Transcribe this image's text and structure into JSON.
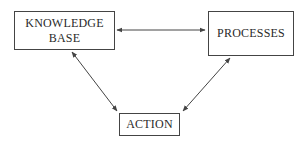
{
  "diagram": {
    "type": "flow",
    "nodes": [
      {
        "id": "knowledge_base",
        "lines": [
          "KNOWLEDGE",
          "BASE"
        ]
      },
      {
        "id": "processes",
        "label": "PROCESSES"
      },
      {
        "id": "action",
        "label": "ACTION"
      }
    ],
    "edges": [
      {
        "from": "knowledge_base",
        "to": "processes",
        "direction": "bidirectional"
      },
      {
        "from": "knowledge_base",
        "to": "action",
        "direction": "bidirectional"
      },
      {
        "from": "processes",
        "to": "action",
        "direction": "bidirectional"
      }
    ],
    "colors": {
      "stroke": "#444444",
      "text": "#2a2a2a",
      "background": "#ffffff"
    }
  }
}
